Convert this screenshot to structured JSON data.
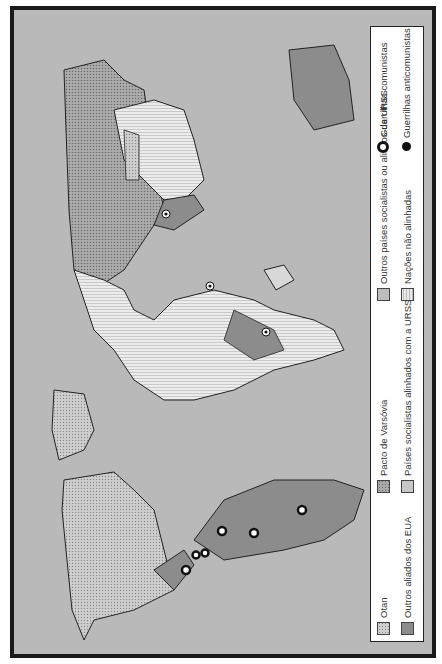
{
  "map": {
    "title": "Guerra Fria — alinhamentos e guerrilhas",
    "orientation": "rotated 90 degrees counterclockwise"
  },
  "legend": {
    "items": [
      {
        "key": "otan",
        "label": "Otan",
        "color": "#cfcfcf",
        "pattern": "dotted"
      },
      {
        "key": "eua",
        "label": "Outros aliados dos EUA",
        "color": "#8c8c8c",
        "pattern": "solid"
      },
      {
        "key": "varsovia",
        "label": "Pacto de Varsóvia",
        "color": "#a9a9a9",
        "pattern": "dotted-dark"
      },
      {
        "key": "alinhados",
        "label": "Países socialistas alinhados com a URSS",
        "color": "#c7c7c7",
        "pattern": "solid-light"
      },
      {
        "key": "outros",
        "label": "Outros países socialistas ou aliados da URSS",
        "color": "#bdbdbd",
        "pattern": "solid-light"
      },
      {
        "key": "naoalinh",
        "label": "Nações não alinhadas",
        "color": "#eaeaea",
        "pattern": "hatched"
      },
      {
        "key": "comunistas",
        "label": "Guerrilhas comunistas",
        "symbol": "ring"
      },
      {
        "key": "anticomunistas",
        "label": "Guerrilhas anticomunistas",
        "symbol": "dot"
      }
    ]
  },
  "colors": {
    "ocean": "#b9b9b9",
    "frame": "#1a1a1a",
    "legend_bg": "#ffffff"
  }
}
